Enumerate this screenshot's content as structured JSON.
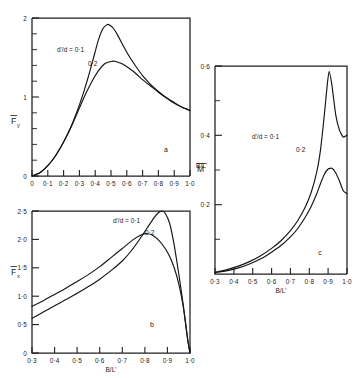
{
  "figure": {
    "background": "#ffffff",
    "ink_color": "#141414"
  },
  "chart_data": [
    {
      "id": "a",
      "type": "line",
      "panel_label": "a",
      "title": "",
      "xlabel": "B/L'",
      "ylabel": "Fy",
      "ylabel_overbar": true,
      "ylabel_sub": "y",
      "xlim": [
        0.0,
        1.0
      ],
      "ylim": [
        0.0,
        2.0
      ],
      "grid": false,
      "xticks": [
        0.0,
        0.1,
        0.2,
        0.3,
        0.4,
        0.5,
        0.6,
        0.7,
        0.8,
        0.9,
        1.0
      ],
      "xticklabels": [
        "0",
        "0·1",
        "0·2",
        "0·3",
        "0·4",
        "0·5",
        "0·6",
        "0·7",
        "0·8",
        "0·9",
        "1·0"
      ],
      "yticks": [
        0,
        1,
        2
      ],
      "yticklabels": [
        "0",
        "1",
        "2"
      ],
      "yminor": [
        0.2,
        0.4,
        0.6,
        0.8,
        1.2,
        1.4,
        1.6,
        1.8
      ],
      "legend_position": "inside-upper-left",
      "series": [
        {
          "name": "d'/d = 0·1",
          "label": "d'/d = 0·1",
          "x": [
            0.0,
            0.05,
            0.1,
            0.15,
            0.2,
            0.25,
            0.3,
            0.33,
            0.36,
            0.39,
            0.42,
            0.45,
            0.48,
            0.51,
            0.54,
            0.58,
            0.62,
            0.66,
            0.7,
            0.75,
            0.8,
            0.85,
            0.9,
            0.95,
            1.0
          ],
          "values": [
            0.0,
            0.04,
            0.13,
            0.26,
            0.43,
            0.64,
            0.9,
            1.08,
            1.28,
            1.5,
            1.72,
            1.87,
            1.92,
            1.88,
            1.79,
            1.64,
            1.5,
            1.38,
            1.27,
            1.16,
            1.07,
            0.99,
            0.92,
            0.87,
            0.83
          ]
        },
        {
          "name": "0·2",
          "label": "0·2",
          "x": [
            0.0,
            0.05,
            0.1,
            0.15,
            0.2,
            0.25,
            0.3,
            0.34,
            0.38,
            0.42,
            0.46,
            0.5,
            0.53,
            0.57,
            0.61,
            0.65,
            0.7,
            0.75,
            0.8,
            0.85,
            0.9,
            0.95,
            1.0
          ],
          "values": [
            0.0,
            0.04,
            0.13,
            0.26,
            0.43,
            0.63,
            0.86,
            1.04,
            1.2,
            1.33,
            1.42,
            1.45,
            1.45,
            1.42,
            1.37,
            1.31,
            1.22,
            1.14,
            1.06,
            0.99,
            0.93,
            0.87,
            0.83
          ]
        }
      ]
    },
    {
      "id": "b",
      "type": "line",
      "panel_label": "b",
      "title": "",
      "xlabel": "B/L'",
      "ylabel": "Fx",
      "ylabel_overbar": true,
      "ylabel_sub": "x",
      "xlim": [
        0.3,
        1.0
      ],
      "ylim": [
        0.0,
        2.5
      ],
      "grid": false,
      "xticks": [
        0.3,
        0.4,
        0.5,
        0.6,
        0.7,
        0.8,
        0.9,
        1.0
      ],
      "xticklabels": [
        "0·3",
        "0·4",
        "0·5",
        "0·6",
        "0·7",
        "0·8",
        "0·9",
        "1·0"
      ],
      "yticks": [
        0.0,
        0.5,
        1.0,
        1.5,
        2.0,
        2.5
      ],
      "yticklabels": [
        "0",
        "0·5",
        "1·0",
        "1·5",
        "2·0",
        "2·5"
      ],
      "legend_position": "inside-upper-center",
      "series": [
        {
          "name": "d'/d = 0·1",
          "label": "d'/d = 0·1",
          "x": [
            0.3,
            0.35,
            0.4,
            0.45,
            0.5,
            0.55,
            0.6,
            0.65,
            0.7,
            0.74,
            0.78,
            0.81,
            0.84,
            0.86,
            0.875,
            0.89,
            0.91,
            0.93,
            0.95,
            0.97,
            0.99,
            1.0
          ],
          "values": [
            0.61,
            0.72,
            0.83,
            0.94,
            1.05,
            1.17,
            1.3,
            1.45,
            1.62,
            1.8,
            2.02,
            2.2,
            2.38,
            2.47,
            2.5,
            2.46,
            2.28,
            1.9,
            1.4,
            0.85,
            0.22,
            0.0
          ]
        },
        {
          "name": "0·2",
          "label": "0·2",
          "x": [
            0.3,
            0.35,
            0.4,
            0.45,
            0.5,
            0.55,
            0.6,
            0.65,
            0.7,
            0.75,
            0.79,
            0.81,
            0.83,
            0.86,
            0.89,
            0.91,
            0.93,
            0.95,
            0.97,
            0.99,
            1.0
          ],
          "values": [
            0.82,
            0.92,
            1.03,
            1.14,
            1.26,
            1.38,
            1.52,
            1.68,
            1.84,
            2.0,
            2.09,
            2.1,
            2.08,
            1.99,
            1.84,
            1.7,
            1.5,
            1.22,
            0.82,
            0.24,
            0.0
          ]
        }
      ]
    },
    {
      "id": "c",
      "type": "line",
      "panel_label": "c",
      "title": "",
      "xlabel": "B/L'",
      "ylabel": "M",
      "ylabel_overbar": true,
      "ylabel_sub": "",
      "xlim": [
        0.3,
        1.0
      ],
      "ylim": [
        0.0,
        0.6
      ],
      "grid": false,
      "xticks": [
        0.3,
        0.4,
        0.5,
        0.6,
        0.7,
        0.8,
        0.9,
        1.0
      ],
      "xticklabels": [
        "0·3",
        "0·4",
        "0·5",
        "0·6",
        "0·7",
        "0·8",
        "0·9",
        "1·0"
      ],
      "yticks": [
        0.2,
        0.4,
        0.6
      ],
      "yticklabels": [
        "0·2",
        "0·4",
        "0·6"
      ],
      "yminor": [
        0.1,
        0.3,
        0.5
      ],
      "legend_position": "inside-upper-center",
      "series": [
        {
          "name": "d'/d = 0·1",
          "label": "d'/d = 0·1",
          "x": [
            0.3,
            0.36,
            0.42,
            0.48,
            0.54,
            0.6,
            0.65,
            0.7,
            0.74,
            0.78,
            0.81,
            0.84,
            0.86,
            0.88,
            0.895,
            0.905,
            0.92,
            0.94,
            0.96,
            0.98,
            1.0
          ],
          "values": [
            0.005,
            0.012,
            0.022,
            0.035,
            0.052,
            0.074,
            0.096,
            0.125,
            0.155,
            0.195,
            0.235,
            0.295,
            0.36,
            0.46,
            0.545,
            0.585,
            0.545,
            0.46,
            0.415,
            0.395,
            0.4
          ]
        },
        {
          "name": "0·2",
          "label": "0·2",
          "x": [
            0.3,
            0.36,
            0.42,
            0.48,
            0.54,
            0.6,
            0.65,
            0.7,
            0.74,
            0.78,
            0.81,
            0.84,
            0.86,
            0.88,
            0.9,
            0.92,
            0.94,
            0.96,
            0.98,
            1.0
          ],
          "values": [
            0.004,
            0.009,
            0.017,
            0.028,
            0.043,
            0.063,
            0.082,
            0.107,
            0.132,
            0.165,
            0.195,
            0.232,
            0.262,
            0.288,
            0.303,
            0.305,
            0.292,
            0.268,
            0.24,
            0.232
          ]
        }
      ]
    }
  ]
}
